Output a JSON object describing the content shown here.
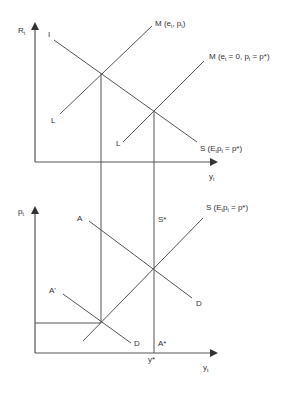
{
  "diagram": {
    "type": "economic-model-two-panel",
    "colors": {
      "line": "#555555",
      "text": "#333333",
      "background": "#ffffff"
    },
    "top_panel": {
      "y_axis_label": "R",
      "y_axis_sub": "t",
      "x_axis_label": "y",
      "x_axis_sub": "t",
      "curves": {
        "IS_start": "I",
        "S_label": "S (E",
        "S_label_sub": "t",
        "S_label_rest": "p",
        "S_label_sub2": "t",
        "S_label_end": " = p*)",
        "LM1_label": "M (e",
        "LM1_sub1": "t",
        "LM1_mid": ", p",
        "LM1_sub2": "t",
        "LM1_end": ")",
        "LM1_start": "L",
        "LM2_label": "M (e",
        "LM2_sub1": "t",
        "LM2_mid": " = 0, p",
        "LM2_sub2": "t",
        "LM2_end": " = p*)",
        "LM2_start": "L"
      }
    },
    "bottom_panel": {
      "y_axis_label": "p",
      "y_axis_sub": "t",
      "x_axis_label": "y",
      "x_axis_sub": "t",
      "curves": {
        "AD1_start": "A",
        "AD1_end": "D",
        "AD2_start": "A'",
        "AD2_end": "D",
        "AS_label": "S (E",
        "AS_sub1": "t",
        "AS_rest": "p",
        "AS_sub2": "t",
        "AS_end": " = p*)",
        "LRAS_top": "S*",
        "LRAS_bottom": "A*",
        "y_star": "y*"
      }
    }
  }
}
